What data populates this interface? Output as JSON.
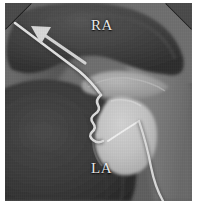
{
  "figure": {
    "modality": "grayscale-ultrasound-scan",
    "width": 197,
    "height": 208,
    "frame": {
      "left": 5,
      "top": 3,
      "width": 187,
      "height": 198,
      "corner_style": "chamfered-top-corners",
      "chamfer_size": 26
    },
    "background_color": "#ffffff"
  },
  "annotations": {
    "chamber_labels": [
      {
        "name": "right-atrium",
        "text": "RA",
        "x": 86,
        "y": 14
      },
      {
        "name": "left-atrium",
        "text": "LA",
        "x": 86,
        "y": 157
      }
    ],
    "arrow": {
      "name": "direction-arrow",
      "description": "white arrow pointing up-left along catheter shaft",
      "from_x": 80,
      "from_y": 60,
      "to_x": 28,
      "to_y": 24,
      "color": "#d8d8d8"
    }
  },
  "structures": {
    "tissue_dark": "#373737",
    "tissue_mid": "#4e4e4e",
    "tissue_light": "#7d7d7d",
    "septum_bright": "#a9a9a9",
    "device_bright": "#c6c6c6",
    "catheter_color": "#e0e0e0",
    "shadow_dark": "#2b2b2b",
    "items": [
      {
        "name": "right-atrium-wall",
        "tone": "#3a3a3a"
      },
      {
        "name": "left-atrium-wall",
        "tone": "#343434"
      },
      {
        "name": "interatrial-septum",
        "tone": "#a0a0a0"
      },
      {
        "name": "balloon-device",
        "tone": "#c6c6c6"
      },
      {
        "name": "catheter-shaft",
        "tone": "#e0e0e0"
      },
      {
        "name": "catheter-wavy-segment",
        "tone": "#dcdcdc"
      },
      {
        "name": "catheter-distal-exit",
        "tone": "#dadada"
      }
    ]
  }
}
